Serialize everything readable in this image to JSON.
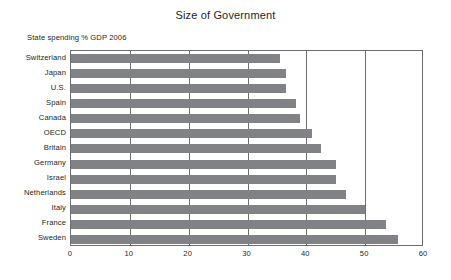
{
  "chart_data": {
    "type": "bar",
    "orientation": "horizontal",
    "title": "Size of Government",
    "subtitle": "State spending % GDP 2006",
    "xlabel": "",
    "ylabel": "",
    "xlim": [
      0,
      60
    ],
    "xticks": [
      0,
      10,
      20,
      30,
      40,
      50,
      60
    ],
    "xtick_labels": [
      "0",
      "10",
      "20",
      "30",
      "40",
      "50",
      "60"
    ],
    "grid": "vertical",
    "legend": "none",
    "bar_color": "#808285",
    "frame_color": "#6d6e71",
    "categories": [
      "Switzerland",
      "Japan",
      "U.S.",
      "Spain",
      "Canada",
      "OECD",
      "Britain",
      "Germany",
      "Israel",
      "Netherlands",
      "Italy",
      "France",
      "Sweden"
    ],
    "values": [
      35.5,
      36.5,
      36.5,
      38.3,
      39,
      41,
      42.5,
      45,
      45,
      46.7,
      50,
      53.5,
      55.5
    ]
  }
}
